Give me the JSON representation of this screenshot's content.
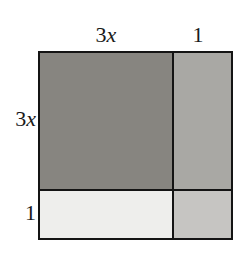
{
  "figure": {
    "outer_border_color": "#141414",
    "background_color": "#ffffff"
  },
  "labels": {
    "top_width": {
      "number": "3",
      "variable": "x",
      "text": "3x"
    },
    "top_unit": {
      "text": "1"
    },
    "left_height": {
      "number": "3",
      "variable": "x",
      "text": "3x"
    },
    "left_unit": {
      "text": "1"
    }
  },
  "regions": [
    {
      "name": "large-square",
      "width_label": "3x",
      "height_label": "3x",
      "area": "9x²",
      "fill": "#878580",
      "shade": "dark gray"
    },
    {
      "name": "right-strip",
      "width_label": "1",
      "height_label": "3x",
      "area": "3x",
      "fill": "#a9a8a4",
      "shade": "medium gray"
    },
    {
      "name": "bottom-strip",
      "width_label": "3x",
      "height_label": "1",
      "area": "3x",
      "fill": "#eeeeec",
      "shade": "very light gray"
    },
    {
      "name": "corner-square",
      "width_label": "1",
      "height_label": "1",
      "area": "1",
      "fill": "#c6c5c2",
      "shade": "light gray"
    }
  ]
}
